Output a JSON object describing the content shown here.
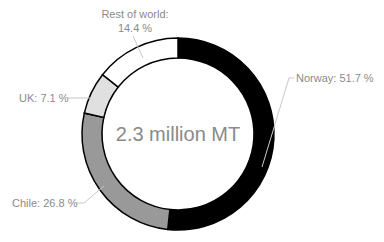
{
  "chart_data": {
    "type": "pie",
    "variant": "donut",
    "title": "",
    "center_label": "2.3 million MT",
    "start_angle_deg": 0,
    "direction": "clockwise",
    "slices": [
      {
        "name": "Norway",
        "value": 51.7,
        "label": "Norway: 51.7 %",
        "color": "#000000"
      },
      {
        "name": "Chile",
        "value": 26.8,
        "label": "Chile: 26.8 %",
        "color": "#999999"
      },
      {
        "name": "UK",
        "value": 7.1,
        "label": "UK: 7.1 %",
        "color": "#e0e0e0"
      },
      {
        "name": "Rest of world",
        "value": 14.4,
        "label_line1": "Rest of world:",
        "label_line2": "14.4 %",
        "color": "#ffffff"
      }
    ],
    "categories": [
      "Norway",
      "Chile",
      "UK",
      "Rest of world"
    ],
    "values": [
      51.7,
      26.8,
      7.1,
      14.4
    ],
    "unit": "%",
    "legend": "none (data labels with leader lines)"
  },
  "style": {
    "label_color": "#8a8a8a",
    "outline_color": "#000000",
    "leader_color": "#c8c8c8"
  }
}
